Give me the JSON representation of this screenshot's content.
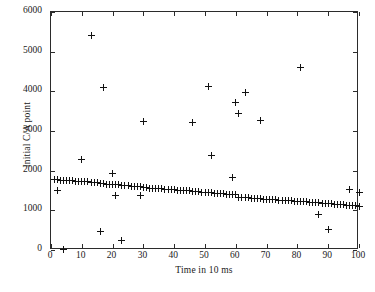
{
  "chart_data": {
    "type": "scatter",
    "title": "",
    "xlabel": "Time in 10 ms",
    "ylabel": "Initial C/A  point",
    "xlim": [
      0,
      100
    ],
    "ylim": [
      0,
      6000
    ],
    "xticks": [
      0,
      10,
      20,
      30,
      40,
      50,
      60,
      70,
      80,
      90,
      100
    ],
    "yticks": [
      0,
      1000,
      2000,
      3000,
      4000,
      5000,
      6000
    ],
    "xtick_labels": [
      "0",
      "10",
      "20",
      "30",
      "40",
      "50",
      "60",
      "70",
      "80",
      "90",
      "100"
    ],
    "ytick_labels": [
      "0",
      "1000",
      "2000",
      "3000",
      "4000",
      "5000",
      "6000"
    ],
    "grid": false,
    "legend": false,
    "marker": "plus",
    "marker_color": "#111111",
    "axis_color": "#2b2b2b",
    "background": "#ffffff",
    "series": [
      {
        "name": "Initial C/A point",
        "points": [
          [
            1,
            1780
          ],
          [
            2,
            1500
          ],
          [
            2,
            1775
          ],
          [
            3,
            1760
          ],
          [
            4,
            10
          ],
          [
            4,
            1755
          ],
          [
            5,
            1752
          ],
          [
            6,
            1745
          ],
          [
            7,
            1742
          ],
          [
            8,
            1738
          ],
          [
            9,
            1735
          ],
          [
            10,
            2270
          ],
          [
            10,
            1730
          ],
          [
            11,
            1722
          ],
          [
            12,
            1715
          ],
          [
            13,
            5420
          ],
          [
            13,
            1712
          ],
          [
            14,
            1705
          ],
          [
            15,
            1700
          ],
          [
            16,
            470
          ],
          [
            16,
            1668
          ],
          [
            17,
            4100
          ],
          [
            17,
            1665
          ],
          [
            18,
            1662
          ],
          [
            19,
            1660
          ],
          [
            20,
            1920
          ],
          [
            20,
            1650
          ],
          [
            21,
            1370
          ],
          [
            21,
            1645
          ],
          [
            22,
            1640
          ],
          [
            23,
            230
          ],
          [
            23,
            1632
          ],
          [
            24,
            1628
          ],
          [
            25,
            1620
          ],
          [
            26,
            1612
          ],
          [
            27,
            1605
          ],
          [
            28,
            1600
          ],
          [
            29,
            1592
          ],
          [
            29,
            1370
          ],
          [
            30,
            3230
          ],
          [
            30,
            1585
          ],
          [
            31,
            1570
          ],
          [
            32,
            1562
          ],
          [
            33,
            1558
          ],
          [
            34,
            1552
          ],
          [
            35,
            1548
          ],
          [
            36,
            1540
          ],
          [
            37,
            1535
          ],
          [
            38,
            1530
          ],
          [
            39,
            1522
          ],
          [
            40,
            1518
          ],
          [
            41,
            1512
          ],
          [
            42,
            1505
          ],
          [
            43,
            1498
          ],
          [
            44,
            1492
          ],
          [
            45,
            1488
          ],
          [
            46,
            3215
          ],
          [
            46,
            1482
          ],
          [
            47,
            1475
          ],
          [
            48,
            1470
          ],
          [
            49,
            1462
          ],
          [
            50,
            1455
          ],
          [
            51,
            4115
          ],
          [
            51,
            1450
          ],
          [
            52,
            2390
          ],
          [
            52,
            1440
          ],
          [
            53,
            1432
          ],
          [
            54,
            1428
          ],
          [
            55,
            1420
          ],
          [
            56,
            1412
          ],
          [
            57,
            1405
          ],
          [
            58,
            1398
          ],
          [
            59,
            1835
          ],
          [
            59,
            1392
          ],
          [
            60,
            3710
          ],
          [
            60,
            1388
          ],
          [
            61,
            3450
          ],
          [
            61,
            1330
          ],
          [
            62,
            1325
          ],
          [
            63,
            3965
          ],
          [
            63,
            1320
          ],
          [
            64,
            1312
          ],
          [
            65,
            1305
          ],
          [
            66,
            1300
          ],
          [
            67,
            1295
          ],
          [
            68,
            3265
          ],
          [
            68,
            1290
          ],
          [
            69,
            1285
          ],
          [
            70,
            1280
          ],
          [
            71,
            1275
          ],
          [
            72,
            1268
          ],
          [
            73,
            1262
          ],
          [
            74,
            1258
          ],
          [
            75,
            1252
          ],
          [
            76,
            1248
          ],
          [
            77,
            1242
          ],
          [
            78,
            1238
          ],
          [
            79,
            1232
          ],
          [
            80,
            1228
          ],
          [
            81,
            4605
          ],
          [
            81,
            1222
          ],
          [
            82,
            1218
          ],
          [
            83,
            1212
          ],
          [
            84,
            1205
          ],
          [
            85,
            1198
          ],
          [
            86,
            1192
          ],
          [
            87,
            890
          ],
          [
            87,
            1185
          ],
          [
            88,
            1178
          ],
          [
            89,
            1172
          ],
          [
            90,
            510
          ],
          [
            90,
            1165
          ],
          [
            91,
            1160
          ],
          [
            92,
            1155
          ],
          [
            93,
            1148
          ],
          [
            94,
            1142
          ],
          [
            95,
            1138
          ],
          [
            96,
            1132
          ],
          [
            97,
            1530
          ],
          [
            97,
            1125
          ],
          [
            98,
            1118
          ],
          [
            99,
            1110
          ],
          [
            100,
            1450
          ],
          [
            100,
            1085
          ]
        ]
      }
    ]
  }
}
